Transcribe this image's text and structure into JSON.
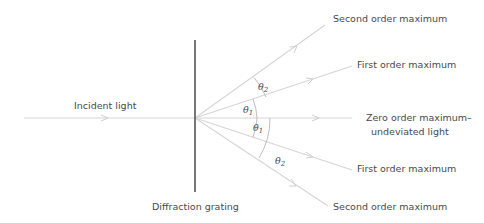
{
  "diagram": {
    "labels": {
      "incident": "Incident light",
      "grating": "Diffraction grating",
      "second_upper": "Second order maximum",
      "first_upper": "First order maximum",
      "zero_line1": "Zero order maximum–",
      "zero_line2": "undeviated light",
      "first_lower": "First order maximum",
      "second_lower": "Second order maximum"
    },
    "angles": {
      "theta": "θ",
      "sub1": "1",
      "sub2": "2"
    },
    "colors": {
      "grating": "#555555",
      "rays": "#d6d6d6",
      "text": "#4a4a4a"
    }
  }
}
